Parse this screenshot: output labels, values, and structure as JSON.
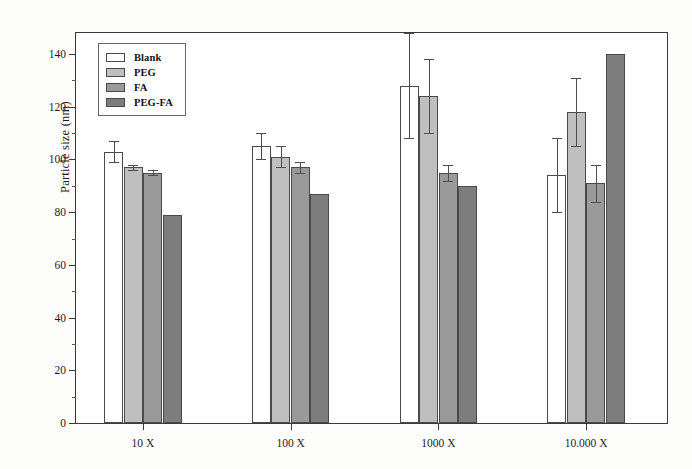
{
  "chart_data": {
    "type": "bar",
    "title": "",
    "xlabel": "",
    "ylabel": "Particle size (nm)",
    "categories": [
      "10 X",
      "100 X",
      "1000 X",
      "10.000 X"
    ],
    "ylim": [
      0,
      148
    ],
    "yticks": [
      0,
      20,
      40,
      60,
      80,
      100,
      120,
      140
    ],
    "ytick_labels": [
      "0",
      "20",
      "40",
      "60",
      "80",
      "100",
      "120",
      "140"
    ],
    "yminor_step": 10,
    "grid": false,
    "legend_position": "upper left",
    "series": [
      {
        "name": "Blank",
        "color": "#ffffff",
        "values": [
          103,
          105,
          128,
          94
        ],
        "errors": [
          4,
          5,
          20,
          14
        ]
      },
      {
        "name": "PEG",
        "color": "#bfbfbf",
        "values": [
          97,
          101,
          124,
          118
        ],
        "errors": [
          1,
          4,
          14,
          13
        ]
      },
      {
        "name": "FA",
        "color": "#9a9a9a",
        "values": [
          95,
          97,
          95,
          91
        ],
        "errors": [
          1,
          2,
          3,
          7
        ]
      },
      {
        "name": "PEG-FA",
        "color": "#7d7d7d",
        "values": [
          79,
          87,
          90,
          140
        ]
      }
    ]
  },
  "legend": {
    "items": [
      {
        "label": "Blank"
      },
      {
        "label": "PEG"
      },
      {
        "label": "FA"
      },
      {
        "label": "PEG-FA"
      }
    ]
  },
  "axes": {
    "y_title": "Particle size (nm)"
  }
}
